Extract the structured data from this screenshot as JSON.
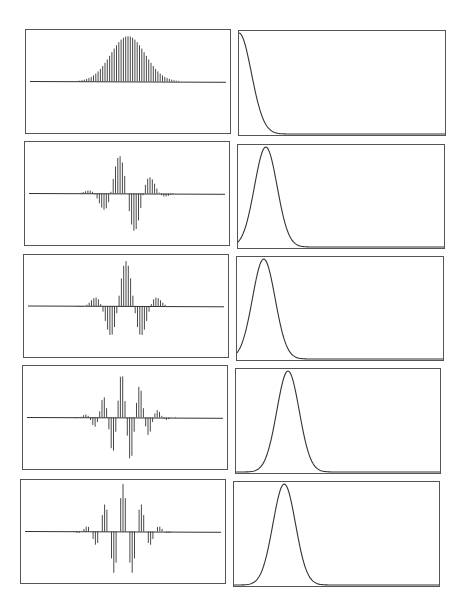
{
  "figure": {
    "layout": {
      "rows": 5,
      "cols": 2
    },
    "line_color": "#333333",
    "frame_color": "#555555"
  },
  "chart_data": [
    {
      "type": "stem",
      "panel": "row1-left",
      "description": "Gaussian window samples (unmodulated)",
      "n_samples": 81,
      "center_index": 40,
      "envelope_sigma": 7.5,
      "modulation_freq": 0.0,
      "modulation_phase": 0.0,
      "amplitude": 1.0,
      "axis": {
        "grid": false,
        "ticks": false,
        "baseline": true
      }
    },
    {
      "type": "line",
      "panel": "row1-right",
      "description": "Magnitude spectrum, peak at zero frequency",
      "peak_position": 0.0,
      "sigma": 0.06,
      "amplitude": 1.0,
      "axis": {
        "grid": false,
        "ticks": false,
        "xlim": [
          0,
          1
        ]
      }
    },
    {
      "type": "stem",
      "panel": "row2-left",
      "description": "Gaussian window modulated, sine phase",
      "n_samples": 81,
      "center_index": 40,
      "envelope_sigma": 7.5,
      "modulation_freq": 0.07,
      "modulation_phase": 1.5708,
      "amplitude": 0.92,
      "axis": {
        "grid": false,
        "ticks": false,
        "baseline": true
      }
    },
    {
      "type": "line",
      "panel": "row2-right",
      "description": "Magnitude spectrum, low-frequency peak",
      "peak_position": 0.135,
      "sigma": 0.055,
      "amplitude": 1.0,
      "axis": {
        "grid": false,
        "ticks": false,
        "xlim": [
          0,
          1
        ]
      }
    },
    {
      "type": "stem",
      "panel": "row3-left",
      "description": "Gaussian window modulated, cosine phase",
      "n_samples": 81,
      "center_index": 40,
      "envelope_sigma": 7.5,
      "modulation_freq": 0.07,
      "modulation_phase": 0.0,
      "amplitude": 1.0,
      "axis": {
        "grid": false,
        "ticks": false,
        "baseline": true
      }
    },
    {
      "type": "line",
      "panel": "row3-right",
      "description": "Magnitude spectrum, low-frequency peak",
      "peak_position": 0.13,
      "sigma": 0.055,
      "amplitude": 1.0,
      "axis": {
        "grid": false,
        "ticks": false,
        "xlim": [
          0,
          1
        ]
      }
    },
    {
      "type": "stem",
      "panel": "row4-left",
      "description": "Gaussian window modulated at higher frequency, sine phase",
      "n_samples": 81,
      "center_index": 40,
      "envelope_sigma": 7.5,
      "modulation_freq": 0.125,
      "modulation_phase": 1.2,
      "amplitude": 1.0,
      "axis": {
        "grid": false,
        "ticks": false,
        "baseline": true
      }
    },
    {
      "type": "line",
      "panel": "row4-right",
      "description": "Magnitude spectrum, mid-frequency peak",
      "peak_position": 0.255,
      "sigma": 0.055,
      "amplitude": 1.0,
      "axis": {
        "grid": false,
        "ticks": false,
        "xlim": [
          0,
          1
        ]
      }
    },
    {
      "type": "stem",
      "panel": "row5-left",
      "description": "Gaussian window modulated at higher frequency, cosine phase",
      "n_samples": 81,
      "center_index": 40,
      "envelope_sigma": 7.5,
      "modulation_freq": 0.125,
      "modulation_phase": 0.0,
      "amplitude": 1.05,
      "axis": {
        "grid": false,
        "ticks": false,
        "baseline": true
      }
    },
    {
      "type": "line",
      "panel": "row5-right",
      "description": "Magnitude spectrum, mid-frequency peak",
      "peak_position": 0.245,
      "sigma": 0.055,
      "amplitude": 1.0,
      "axis": {
        "grid": false,
        "ticks": false,
        "xlim": [
          0,
          1
        ]
      }
    }
  ]
}
